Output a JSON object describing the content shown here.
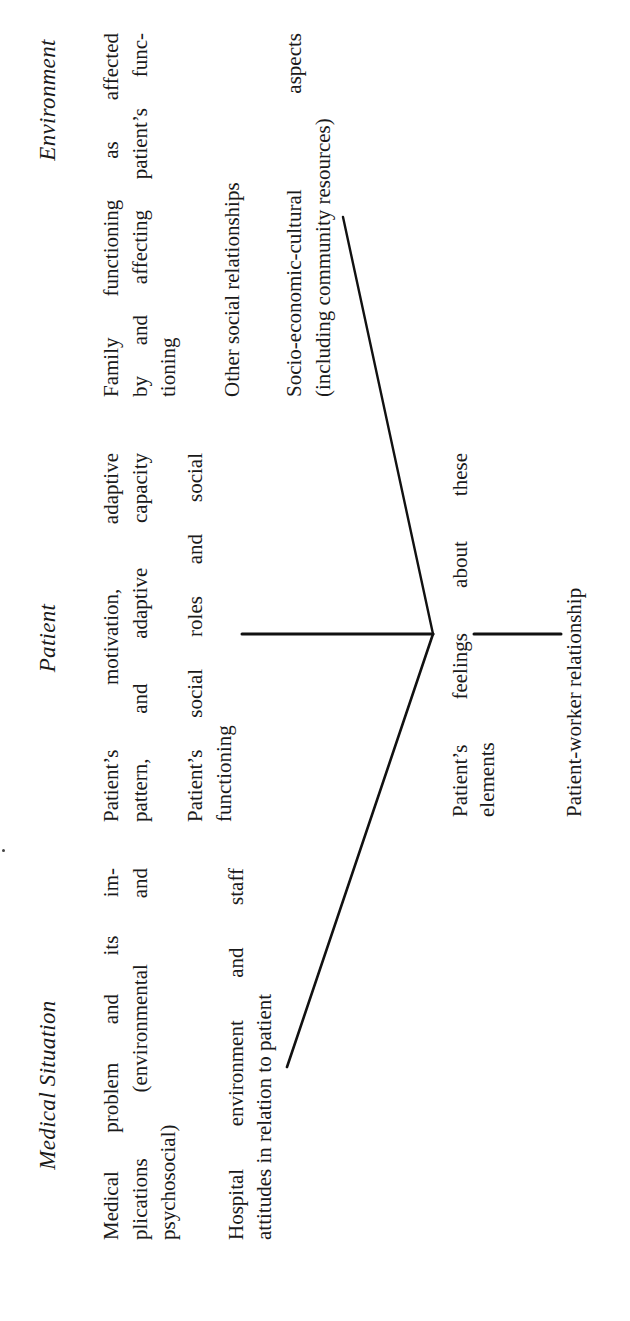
{
  "diagram": {
    "columns": [
      {
        "heading": "Medical Situation",
        "items": [
          "Medical problem and its implications (environmental and psychosocial)",
          "Hospital environment and staff attitudes in relation to patient"
        ],
        "lines": [
          [
            "Medical problem and its im-",
            "plications (environmental and",
            "psychosocial)"
          ],
          [
            "Hospital environment and staff",
            "attitudes in relation to patient"
          ]
        ]
      },
      {
        "heading": "Patient",
        "items": [
          "Patient's motivation, adaptive pattern, and adaptive capacity",
          "Patient's social roles and social functioning"
        ],
        "lines": [
          [
            "Patient’s motivation, adaptive",
            "pattern, and adaptive capacity"
          ],
          [
            "Patient’s social roles and social",
            "functioning"
          ]
        ]
      },
      {
        "heading": "Environment",
        "items": [
          "Family functioning as affected by and affecting patient's functioning",
          "Other social relationships",
          "Socio-economic-cultural aspects (including community resources)"
        ],
        "lines": [
          [
            "Family functioning as affected",
            "by and affecting patient’s func-",
            "tioning"
          ],
          [
            "Other social relationships"
          ],
          [
            "Socio-economic-cultural aspects",
            "(including community resources)"
          ]
        ]
      }
    ],
    "center": {
      "feelings_lines": [
        "Patient’s feelings about these",
        "elements"
      ],
      "relationship": "Patient-worker relationship"
    },
    "orientation": "rotated 90° counter-clockwise",
    "line_color": "#111111",
    "text_color": "#1a1a1a"
  }
}
